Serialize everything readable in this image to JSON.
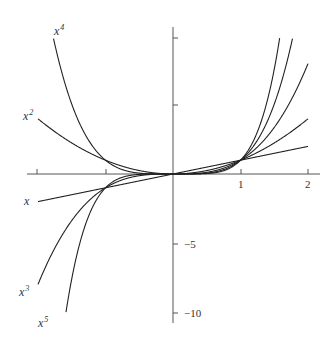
{
  "chart_data": {
    "type": "line",
    "title": "",
    "xlabel": "",
    "ylabel": "",
    "xlim": [
      -2.1,
      2.1
    ],
    "ylim": [
      -10.5,
      10.5
    ],
    "grid": false,
    "legend": "inline curve labels",
    "x_ticks": [
      -2,
      -1,
      1,
      2
    ],
    "x_tick_labels": [
      "",
      "",
      "1",
      "2"
    ],
    "y_ticks": [
      10,
      5,
      -5,
      -10
    ],
    "y_tick_labels": [
      "",
      "",
      "−5",
      "−10"
    ],
    "series": [
      {
        "name": "x",
        "exponent": 1,
        "label_text": "x",
        "label_sup": ""
      },
      {
        "name": "x^2",
        "exponent": 2,
        "label_text": "x",
        "label_sup": "2"
      },
      {
        "name": "x^3",
        "exponent": 3,
        "label_text": "x",
        "label_sup": "3"
      },
      {
        "name": "x^4",
        "exponent": 4,
        "label_text": "x",
        "label_sup": "4"
      },
      {
        "name": "x^5",
        "exponent": 5,
        "label_text": "x",
        "label_sup": "5"
      }
    ]
  },
  "labels": {
    "x": {
      "base": "x",
      "sup": ""
    },
    "x2": {
      "base": "x",
      "sup": "2"
    },
    "x3": {
      "base": "x",
      "sup": "3"
    },
    "x4": {
      "base": "x",
      "sup": "4"
    },
    "x5": {
      "base": "x",
      "sup": "5"
    },
    "tick_x1": "1",
    "tick_x2": "2",
    "tick_y_neg5": "−5",
    "tick_y_neg10": "−10"
  }
}
